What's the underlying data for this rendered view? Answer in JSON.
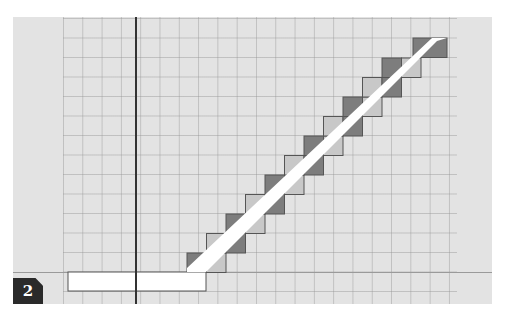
{
  "figure": {
    "label": "2",
    "grid": {
      "cell_px": 19.3,
      "columns": 20,
      "rows": 14
    },
    "colors": {
      "background": "#e3e3e3",
      "grid_line": "#a0a0a0",
      "axis": "#333333",
      "band": "#ffffff",
      "step_dark": "#7d7d7d",
      "step_light": "#c8c8c8",
      "outline": "#555555",
      "badge_bg": "#2a2a2a",
      "badge_fg": "#ffffff"
    }
  }
}
